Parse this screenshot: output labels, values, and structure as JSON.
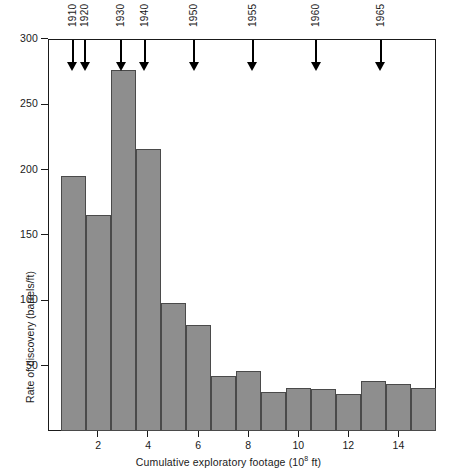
{
  "chart_data": {
    "type": "bar",
    "title": "",
    "subtitle": "",
    "xlabel": "Cumulative exploratory footage (10⁸ ft)",
    "xlabel_base": "Cumulative exploratory footage (10",
    "xlabel_sup": "8",
    "xlabel_tail": " ft)",
    "ylabel": "Rate of discovery (barrels/ft)",
    "xlim": [
      0,
      15.5
    ],
    "ylim": [
      0,
      300
    ],
    "grid": false,
    "legend": null,
    "bar_color": "#8e8e8e",
    "bar_edge_color": "#4a4a4a",
    "axis_color": "#1a1a1a",
    "bin_width": 1,
    "x_ticks": [
      2,
      4,
      6,
      8,
      10,
      12,
      14
    ],
    "x_tick_labels": [
      "2",
      "4",
      "6",
      "8",
      "10",
      "12",
      "14"
    ],
    "y_ticks": [
      50,
      100,
      150,
      200,
      250,
      300
    ],
    "y_tick_labels": [
      "50",
      "100",
      "150",
      "200",
      "250",
      "300"
    ],
    "bins": [
      {
        "x_start": 0.5,
        "x_end": 1.5,
        "value": 195
      },
      {
        "x_start": 1.5,
        "x_end": 2.5,
        "value": 165
      },
      {
        "x_start": 2.5,
        "x_end": 3.5,
        "value": 276
      },
      {
        "x_start": 3.5,
        "x_end": 4.5,
        "value": 216
      },
      {
        "x_start": 4.5,
        "x_end": 5.5,
        "value": 98
      },
      {
        "x_start": 5.5,
        "x_end": 6.5,
        "value": 81
      },
      {
        "x_start": 6.5,
        "x_end": 7.5,
        "value": 42
      },
      {
        "x_start": 7.5,
        "x_end": 8.5,
        "value": 46
      },
      {
        "x_start": 8.5,
        "x_end": 9.5,
        "value": 30
      },
      {
        "x_start": 9.5,
        "x_end": 10.5,
        "value": 33
      },
      {
        "x_start": 10.5,
        "x_end": 11.5,
        "value": 32
      },
      {
        "x_start": 11.5,
        "x_end": 12.5,
        "value": 28
      },
      {
        "x_start": 12.5,
        "x_end": 13.5,
        "value": 38
      },
      {
        "x_start": 13.5,
        "x_end": 14.5,
        "value": 36
      },
      {
        "x_start": 14.5,
        "x_end": 15.5,
        "value": 33
      }
    ],
    "annotations": [
      {
        "label": "1910",
        "x": 0.95
      },
      {
        "label": "1920",
        "x": 1.45
      },
      {
        "label": "1930",
        "x": 2.88
      },
      {
        "label": "1940",
        "x": 3.82
      },
      {
        "label": "1950",
        "x": 5.8
      },
      {
        "label": "1955",
        "x": 8.13
      },
      {
        "label": "1960",
        "x": 10.68
      },
      {
        "label": "1965",
        "x": 13.26
      }
    ]
  }
}
